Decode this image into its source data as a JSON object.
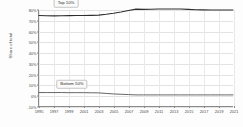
{
  "chart_data": {
    "type": "line",
    "title": "",
    "xlabel": "",
    "ylabel": "Share of total",
    "xlim": [
      1995,
      2021
    ],
    "ylim": [
      -10,
      80
    ],
    "grid": true,
    "legend_position": "inline-annotations",
    "x": [
      1995,
      1996,
      1997,
      1998,
      1999,
      2000,
      2001,
      2002,
      2003,
      2004,
      2005,
      2006,
      2007,
      2008,
      2009,
      2010,
      2011,
      2012,
      2013,
      2014,
      2015,
      2016,
      2017,
      2018,
      2019,
      2020,
      2021
    ],
    "y_tick_labels": [
      "80%",
      "70%",
      "60%",
      "50%",
      "40%",
      "30%",
      "20%",
      "10%",
      "0%",
      "-10%"
    ],
    "y_tick_values": [
      80,
      70,
      60,
      50,
      40,
      30,
      20,
      10,
      0,
      -10
    ],
    "x_tick_labels": [
      "1995",
      "1997",
      "1999",
      "2001",
      "2003",
      "2005",
      "2007",
      "2009",
      "2011",
      "2013",
      "2015",
      "2017",
      "2019",
      "2021"
    ],
    "x_tick_values": [
      1995,
      1997,
      1999,
      2001,
      2003,
      2005,
      2007,
      2009,
      2011,
      2013,
      2015,
      2017,
      2019,
      2021
    ],
    "series": [
      {
        "name": "Top 10%",
        "label": "Top 10%",
        "color": "#2e2e2e",
        "values": [
          74.8,
          74.6,
          74.5,
          74.6,
          74.7,
          74.8,
          74.9,
          75.0,
          75.2,
          76.0,
          77.0,
          78.2,
          79.6,
          80.8,
          80.6,
          80.7,
          80.9,
          81.0,
          81.0,
          80.9,
          80.6,
          80.3,
          80.1,
          80.0,
          80.0,
          80.0,
          80.0
        ]
      },
      {
        "name": "Bottom 50%",
        "label": "Bottom 50%",
        "color": "#555555",
        "values": [
          2.6,
          2.6,
          2.6,
          2.6,
          2.5,
          2.5,
          2.5,
          2.4,
          2.3,
          1.8,
          1.3,
          1.0,
          0.7,
          0.4,
          0.4,
          0.4,
          0.4,
          0.4,
          0.4,
          0.4,
          0.4,
          0.4,
          0.4,
          0.4,
          0.4,
          0.4,
          0.4
        ]
      }
    ],
    "annotations": [
      {
        "name": "top-10-label",
        "text": "Top 10%",
        "x": 1998.6,
        "y": 86.5
      },
      {
        "name": "bottom-50-label",
        "text": "Bottom 50%",
        "x": 1999.4,
        "y": 11.0
      }
    ]
  }
}
